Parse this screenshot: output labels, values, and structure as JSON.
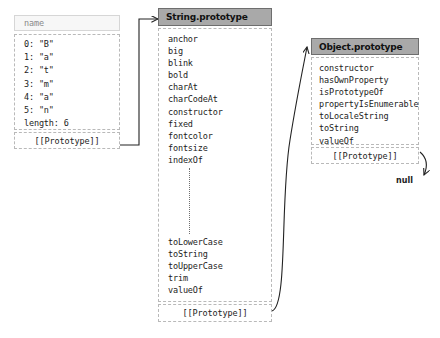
{
  "diagram": {
    "colors": {
      "header_fill": "#a9a9a9",
      "header_border": "#6e6e6e",
      "box_border": "#b9b9b9",
      "light_header_fill": "#f7f7f7",
      "text": "#1c1c1c",
      "connector": "#222222"
    }
  },
  "string_object": {
    "header_label": "name",
    "properties": [
      {
        "key": "0",
        "value": "\"B\"",
        "text": "0: \"B\""
      },
      {
        "key": "1",
        "value": "\"a\"",
        "text": "1: \"a\""
      },
      {
        "key": "2",
        "value": "\"t\"",
        "text": "2: \"t\""
      },
      {
        "key": "3",
        "value": "\"m\"",
        "text": "3: \"m\""
      },
      {
        "key": "4",
        "value": "\"a\"",
        "text": "4: \"a\""
      },
      {
        "key": "5",
        "value": "\"n\"",
        "text": "5: \"n\""
      },
      {
        "key": "length",
        "value": "6",
        "text": "length: 6"
      }
    ],
    "prototype_label": "[[Prototype]]"
  },
  "string_prototype": {
    "header_label": "String.prototype",
    "members_top": [
      "anchor",
      "big",
      "blink",
      "bold",
      "charAt",
      "charCodeAt",
      "constructor",
      "fixed",
      "fontcolor",
      "fontsize",
      "indexOf"
    ],
    "ellipsis": "⋮",
    "members_bottom": [
      "toLowerCase",
      "toString",
      "toUpperCase",
      "trim",
      "valueOf"
    ],
    "prototype_label": "[[Prototype]]"
  },
  "object_prototype": {
    "header_label": "Object.prototype",
    "members": [
      "constructor",
      "hasOwnProperty",
      "isPrototypeOf",
      "propertyIsEnumerable",
      "toLocaleString",
      "toString",
      "valueOf"
    ],
    "prototype_label": "[[Prototype]]"
  },
  "terminator": {
    "label": "null"
  }
}
